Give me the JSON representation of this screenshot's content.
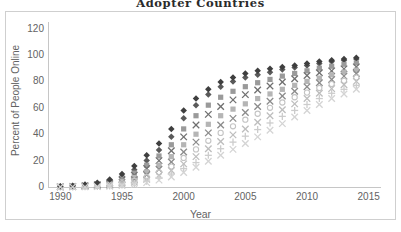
{
  "chart_data": {
    "type": "scatter",
    "title": "Adopter Countries",
    "xlabel": "Year",
    "ylabel": "Percent of People Online",
    "xlim": [
      1989,
      2016
    ],
    "ylim": [
      0,
      125
    ],
    "xticks": [
      1990,
      1995,
      2000,
      2005,
      2010,
      2015
    ],
    "yticks": [
      0,
      20,
      40,
      60,
      80,
      100,
      120
    ],
    "grid": false,
    "legend": "none",
    "x": [
      1990,
      1991,
      1992,
      1993,
      1994,
      1995,
      1996,
      1997,
      1998,
      1999,
      2000,
      2001,
      2002,
      2003,
      2004,
      2005,
      2006,
      2007,
      2008,
      2009,
      2010,
      2011,
      2012,
      2013,
      2014
    ],
    "series": [
      {
        "name": "series-1",
        "marker": "diamond",
        "color": "#5a5a5a",
        "values": [
          0.4,
          0.8,
          1.4,
          2.6,
          4.5,
          8.0,
          13.0,
          20.0,
          28.0,
          38.0,
          52.0,
          62.0,
          70.0,
          76.0,
          80.0,
          83.0,
          85.0,
          87.0,
          89.0,
          90.5,
          92.0,
          93.5,
          95.0,
          96.0,
          97.0
        ]
      },
      {
        "name": "series-2",
        "marker": "square",
        "color": "#9a9a9a",
        "values": [
          0.3,
          0.6,
          1.1,
          2.0,
          3.6,
          6.5,
          10.5,
          16.5,
          23.5,
          32.0,
          44.0,
          54.0,
          62.0,
          68.0,
          72.5,
          76.0,
          79.0,
          81.5,
          84.0,
          86.0,
          88.0,
          90.0,
          91.5,
          93.0,
          94.0
        ]
      },
      {
        "name": "series-3",
        "marker": "cross",
        "color": "#707070",
        "values": [
          0.2,
          0.5,
          0.9,
          1.7,
          3.0,
          5.5,
          9.0,
          14.0,
          20.0,
          27.5,
          38.0,
          47.0,
          55.0,
          61.0,
          66.0,
          70.0,
          73.5,
          76.5,
          79.5,
          82.0,
          84.5,
          86.5,
          88.0,
          89.5,
          91.0
        ]
      },
      {
        "name": "series-4",
        "marker": "square",
        "color": "#b5b5b5",
        "values": [
          0.2,
          0.4,
          0.7,
          1.3,
          2.4,
          4.4,
          7.2,
          11.5,
          16.5,
          23.0,
          32.0,
          40.0,
          47.5,
          54.0,
          59.0,
          63.0,
          67.0,
          70.5,
          74.0,
          77.0,
          80.0,
          82.5,
          85.0,
          87.0,
          88.5
        ]
      },
      {
        "name": "series-5",
        "marker": "x",
        "color": "#8c8c8c",
        "values": [
          0.1,
          0.3,
          0.6,
          1.0,
          1.9,
          3.5,
          5.8,
          9.2,
          13.5,
          19.0,
          26.5,
          34.0,
          41.0,
          47.0,
          52.0,
          56.5,
          61.0,
          65.0,
          69.0,
          72.5,
          76.0,
          79.0,
          81.5,
          84.0,
          86.0
        ]
      },
      {
        "name": "series-6",
        "marker": "circle",
        "color": "#c4c4c4",
        "values": [
          0.1,
          0.2,
          0.4,
          0.8,
          1.5,
          2.8,
          4.6,
          7.4,
          11.0,
          15.5,
          22.0,
          28.5,
          35.0,
          41.0,
          46.0,
          51.0,
          55.5,
          60.0,
          64.0,
          68.0,
          71.5,
          75.0,
          78.0,
          80.5,
          83.0
        ]
      },
      {
        "name": "series-7",
        "marker": "x",
        "color": "#bdbdbd",
        "values": [
          0.1,
          0.2,
          0.3,
          0.6,
          1.1,
          2.1,
          3.6,
          5.8,
          8.8,
          12.5,
          17.5,
          23.0,
          29.0,
          34.5,
          39.5,
          44.0,
          49.0,
          54.0,
          58.5,
          63.0,
          67.0,
          71.0,
          74.5,
          77.5,
          80.0
        ]
      },
      {
        "name": "series-8",
        "marker": "plus",
        "color": "#cccccc",
        "values": [
          0.0,
          0.1,
          0.2,
          0.4,
          0.8,
          1.6,
          2.7,
          4.4,
          6.8,
          9.8,
          14.0,
          18.5,
          24.0,
          29.0,
          34.0,
          38.5,
          43.5,
          48.5,
          53.5,
          58.0,
          62.5,
          67.0,
          71.0,
          74.0,
          77.0
        ]
      },
      {
        "name": "series-9",
        "marker": "diamond",
        "color": "#3f3f3f",
        "values": [
          0.5,
          1.0,
          1.8,
          3.2,
          5.6,
          9.8,
          16.0,
          24.0,
          33.0,
          44.0,
          58.0,
          67.0,
          74.0,
          79.5,
          83.0,
          86.0,
          88.0,
          89.5,
          91.0,
          92.0,
          93.5,
          95.0,
          96.0,
          97.0,
          98.0
        ]
      },
      {
        "name": "series-10",
        "marker": "x",
        "color": "#d4d4d4",
        "values": [
          0.0,
          0.1,
          0.1,
          0.3,
          0.6,
          1.2,
          2.0,
          3.3,
          5.2,
          7.6,
          11.0,
          15.0,
          19.5,
          24.0,
          28.5,
          33.0,
          38.0,
          43.0,
          48.0,
          53.0,
          58.0,
          62.5,
          67.0,
          70.5,
          74.0
        ]
      }
    ]
  }
}
